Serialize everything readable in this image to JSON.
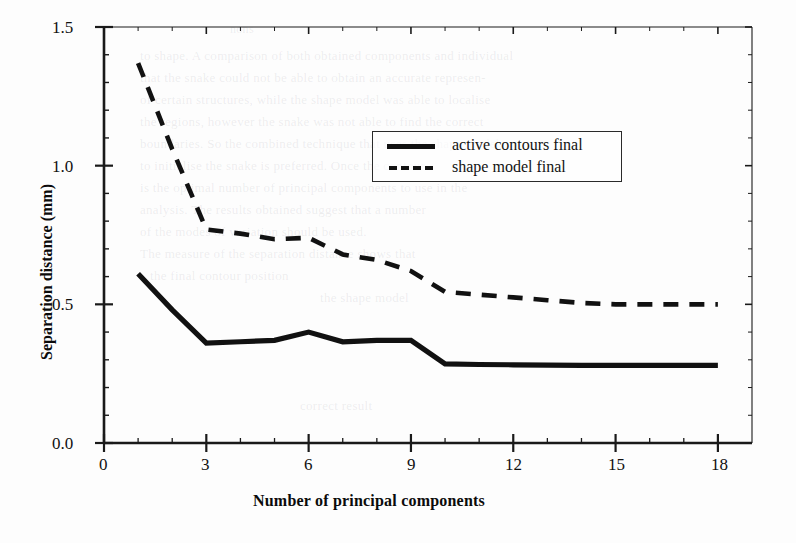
{
  "chart_data": {
    "type": "line",
    "title": "",
    "xlabel": "Number of principal components",
    "ylabel": "Separation distance (mm)",
    "xlim": [
      0,
      19.0
    ],
    "ylim": [
      0.0,
      1.5
    ],
    "grid": false,
    "legend_position": "upper-right-inside",
    "x_ticks": [
      0,
      3,
      6,
      9,
      12,
      15,
      18
    ],
    "x_tick_labels": [
      "0",
      "3",
      "6",
      "9",
      "12",
      "15",
      "18"
    ],
    "x_minor_step": 1,
    "y_ticks": [
      0.0,
      0.5,
      1.0,
      1.5
    ],
    "y_tick_labels": [
      "0.0",
      "0.5",
      "1.0",
      "1.5"
    ],
    "y_minor_step": 0.1,
    "x": [
      1,
      2,
      3,
      4,
      5,
      6,
      7,
      8,
      9,
      10,
      11,
      12,
      13,
      14,
      15,
      16,
      17,
      18
    ],
    "series": [
      {
        "name": "active contours final",
        "style": "solid",
        "color": "#111111",
        "values": [
          0.61,
          0.48,
          0.36,
          0.365,
          0.37,
          0.4,
          0.365,
          0.37,
          0.37,
          0.285,
          0.283,
          0.282,
          0.281,
          0.28,
          0.28,
          0.28,
          0.28,
          0.28
        ]
      },
      {
        "name": "shape model final",
        "style": "dashed",
        "color": "#111111",
        "values": [
          1.37,
          1.06,
          0.77,
          0.755,
          0.735,
          0.74,
          0.68,
          0.66,
          0.62,
          0.545,
          0.535,
          0.525,
          0.515,
          0.505,
          0.5,
          0.5,
          0.5,
          0.5
        ]
      }
    ]
  },
  "legend": {
    "entries": [
      {
        "label": "active contours final",
        "style": "solid"
      },
      {
        "label": "shape model final",
        "style": "dashed"
      }
    ]
  },
  "background_text": [
    "nons",
    "to shape. A comparison of both obtained components and individual",
    "that the snake could not be able to obtain an accurate represen-",
    "of certain structures, while the shape model was able to localise",
    "the regions, however the snake was not able to find the correct",
    "boundaries. So the combined technique that uses the shape model",
    "to initialise the snake is preferred. Once the contour",
    "is the optimal number of principal components to use in the",
    "analysis. The results obtained suggest that a number",
    "of the modes of variation should be used.",
    "The measure of the separation distance shows that",
    "the final contour position",
    "the shape model",
    "correct result"
  ],
  "colors": {
    "ink": "#111111",
    "paper": "#fdfdfd",
    "axis": "#1a1a1a"
  }
}
